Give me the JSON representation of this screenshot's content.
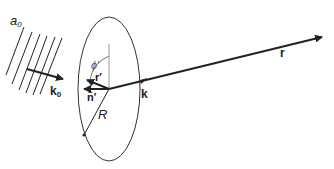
{
  "diagram": {
    "labels": {
      "wave_amplitude": "a",
      "wave_amplitude_sub": "0",
      "incident_wavevector": "k",
      "incident_wavevector_sub": "0",
      "azimuth_angle": "ϕ′",
      "source_point": "r′",
      "normal_vector": "n̂′",
      "radius": "R",
      "scattered_wavevector": "k",
      "observation_vector": "r"
    },
    "colors": {
      "stroke": "#222222",
      "ellipse": "#333333",
      "background": "#ffffff"
    }
  }
}
